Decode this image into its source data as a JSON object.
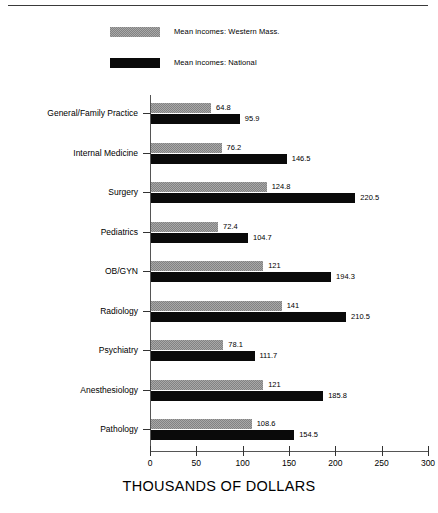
{
  "legend": {
    "items": [
      {
        "label": "Mean incomes: Western Mass.",
        "swatch": "gray-dither-swatch",
        "color": "#828282"
      },
      {
        "label": "Mean incomes: National",
        "swatch": "black-swatch",
        "color": "#0a0a0a"
      }
    ]
  },
  "axis": {
    "title": "THOUSANDS OF DOLLARS",
    "ticks": [
      "0",
      "50",
      "100",
      "150",
      "200",
      "250",
      "300"
    ]
  },
  "chart_data": {
    "type": "bar",
    "orientation": "horizontal",
    "title": "",
    "subtitle": "",
    "xlabel": "THOUSANDS OF DOLLARS",
    "ylabel": "",
    "xlim": [
      0,
      300
    ],
    "xticks": [
      0,
      50,
      100,
      150,
      200,
      250,
      300
    ],
    "grid": false,
    "legend_position": "top-left",
    "categories": [
      "General/Family Practice",
      "Internal Medicine",
      "Surgery",
      "Pediatrics",
      "OB/GYN",
      "Radiology",
      "Psychiatry",
      "Anesthesiology",
      "Pathology"
    ],
    "series": [
      {
        "name": "Mean incomes: Western Mass.",
        "color": "#828282",
        "values": [
          64.8,
          76.2,
          124.8,
          72.4,
          121,
          141,
          78.1,
          121,
          108.6
        ],
        "labels": [
          "64.8",
          "76.2",
          "124.8",
          "72.4",
          "121",
          "141",
          "78.1",
          "121",
          "108.6"
        ]
      },
      {
        "name": "Mean incomes: National",
        "color": "#0a0a0a",
        "values": [
          95.9,
          146.5,
          220.5,
          104.7,
          194.3,
          210.5,
          111.7,
          185.8,
          154.5
        ],
        "labels": [
          "95.9",
          "146.5",
          "220.5",
          "104.7",
          "194.3",
          "210.5",
          "111.7",
          "185.8",
          "154.5"
        ]
      }
    ]
  }
}
